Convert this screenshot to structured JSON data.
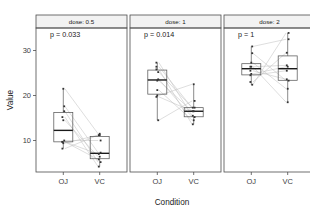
{
  "chart_data": {
    "type": "box",
    "title": "",
    "xlabel": "Condition",
    "ylabel": "Value",
    "ylim": [
      3,
      35
    ],
    "yticks": [
      10,
      20,
      30
    ],
    "ytick_labels": [
      "10",
      "20",
      "30"
    ],
    "categories": [
      "OJ",
      "VC"
    ],
    "grid": false,
    "legend": "none",
    "facet_var": "dose",
    "facets": [
      {
        "strip_label": "dose: 0.5",
        "annotation": "p = 0.033",
        "p_value": 0.033,
        "groups": [
          {
            "name": "OJ",
            "values": [
              15.2,
              21.5,
              17.6,
              9.7,
              14.5,
              10.0,
              8.2,
              9.4,
              16.5,
              9.7
            ],
            "q1": 9.7,
            "median": 12.25,
            "q3": 16.2,
            "lower": 8.2,
            "upper": 21.5
          },
          {
            "name": "VC",
            "values": [
              4.2,
              11.5,
              7.3,
              5.8,
              6.4,
              10.0,
              11.2,
              11.2,
              5.2,
              7.0
            ],
            "q1": 5.95,
            "median": 7.15,
            "q3": 10.9,
            "lower": 4.2,
            "upper": 11.5
          }
        ],
        "pairs": [
          [
            15.2,
            4.2
          ],
          [
            21.5,
            11.5
          ],
          [
            17.6,
            7.3
          ],
          [
            9.7,
            5.8
          ],
          [
            14.5,
            6.4
          ],
          [
            10.0,
            10.0
          ],
          [
            8.2,
            11.2
          ],
          [
            9.4,
            11.2
          ],
          [
            16.5,
            5.2
          ],
          [
            9.7,
            7.0
          ]
        ]
      },
      {
        "strip_label": "dose: 1",
        "annotation": "p = 0.014",
        "p_value": 0.014,
        "groups": [
          {
            "name": "OJ",
            "values": [
              19.7,
              23.3,
              23.6,
              26.4,
              20.0,
              25.2,
              25.8,
              21.2,
              14.5,
              27.3
            ],
            "q1": 20.3,
            "median": 23.45,
            "q3": 25.65,
            "lower": 14.5,
            "upper": 27.3
          },
          {
            "name": "VC",
            "values": [
              16.5,
              16.5,
              15.2,
              17.3,
              22.5,
              17.3,
              13.6,
              14.5,
              18.8,
              15.5
            ],
            "q1": 15.27,
            "median": 16.5,
            "q3": 17.3,
            "lower": 13.6,
            "upper": 22.5
          }
        ],
        "pairs": [
          [
            19.7,
            16.5
          ],
          [
            23.3,
            16.5
          ],
          [
            23.6,
            15.2
          ],
          [
            26.4,
            17.3
          ],
          [
            20.0,
            22.5
          ],
          [
            25.2,
            17.3
          ],
          [
            25.8,
            13.6
          ],
          [
            21.2,
            14.5
          ],
          [
            14.5,
            18.8
          ],
          [
            27.3,
            15.5
          ]
        ]
      },
      {
        "strip_label": "dose: 2",
        "annotation": "p = 1",
        "p_value": 1,
        "groups": [
          {
            "name": "OJ",
            "values": [
              25.5,
              26.4,
              22.4,
              24.5,
              24.8,
              30.9,
              26.4,
              27.3,
              29.4,
              23.0
            ],
            "q1": 24.58,
            "median": 25.95,
            "q3": 27.07,
            "lower": 22.4,
            "upper": 30.9
          },
          {
            "name": "VC",
            "values": [
              23.6,
              18.5,
              33.9,
              25.5,
              26.4,
              32.5,
              26.7,
              21.5,
              23.3,
              29.5
            ],
            "q1": 23.38,
            "median": 25.95,
            "q3": 28.8,
            "lower": 18.5,
            "upper": 33.9
          }
        ],
        "pairs": [
          [
            25.5,
            23.6
          ],
          [
            26.4,
            18.5
          ],
          [
            22.4,
            33.9
          ],
          [
            24.5,
            25.5
          ],
          [
            24.8,
            26.4
          ],
          [
            30.9,
            32.5
          ],
          [
            26.4,
            26.7
          ],
          [
            27.3,
            21.5
          ],
          [
            29.4,
            23.3
          ],
          [
            23.0,
            29.5
          ]
        ]
      }
    ]
  }
}
